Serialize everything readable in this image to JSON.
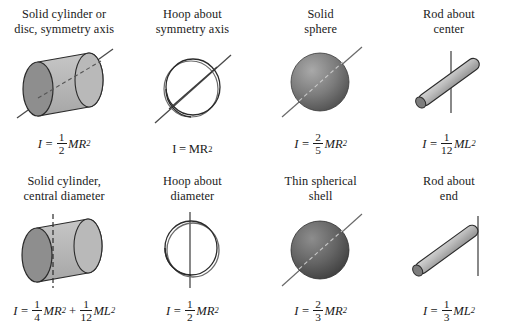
{
  "figure": {
    "columns": 4,
    "rows": 2,
    "background": "#ffffff",
    "ink": "#1a1a1a"
  },
  "palette": {
    "cylinder_body": "#b7b7b7",
    "cylinder_face": "#8e8e8e",
    "sphere_light": "#9a9a9a",
    "sphere_dark": "#4a4a4a",
    "shell_light": "#7e7e7e",
    "shell_dark": "#3a3a3a",
    "rod_body": "#c2c2c2",
    "rod_cap": "#7d7d7d",
    "outline": "#2b2b2b"
  },
  "cells": [
    {
      "id": "solid-cylinder-symmetry-axis",
      "caption": "Solid cylinder or\ndisc, symmetry axis",
      "shape": "cylinder-diagonal-axis",
      "formula": {
        "symbol": "I",
        "equals": "=",
        "terms": [
          {
            "numerator": "1",
            "denominator": "2",
            "body": "MR",
            "exponent": "2"
          }
        ],
        "text": "I = 1/2 MR^2"
      }
    },
    {
      "id": "hoop-symmetry-axis",
      "caption": "Hoop about\nsymmetry axis",
      "shape": "hoop-diagonal-axis",
      "formula": {
        "symbol": "I",
        "equals": "=",
        "terms": [
          {
            "numerator": "",
            "denominator": "",
            "body": "MR",
            "exponent": "2"
          }
        ],
        "text": "I = MR^2"
      }
    },
    {
      "id": "solid-sphere",
      "caption": "Solid\nsphere",
      "shape": "sphere-diagonal-axis",
      "formula": {
        "symbol": "I",
        "equals": "=",
        "terms": [
          {
            "numerator": "2",
            "denominator": "5",
            "body": "MR",
            "exponent": "2"
          }
        ],
        "text": "I = 2/5 MR^2"
      }
    },
    {
      "id": "rod-about-center",
      "caption": "Rod about\ncenter",
      "shape": "rod-center-axis",
      "formula": {
        "symbol": "I",
        "equals": "=",
        "terms": [
          {
            "numerator": "1",
            "denominator": "12",
            "body": "ML",
            "exponent": "2"
          }
        ],
        "text": "I = 1/12 ML^2"
      }
    },
    {
      "id": "solid-cylinder-central-diameter",
      "caption": "Solid cylinder,\ncentral diameter",
      "shape": "cylinder-vertical-axis",
      "formula": {
        "symbol": "I",
        "equals": "=",
        "terms": [
          {
            "numerator": "1",
            "denominator": "4",
            "body": "MR",
            "exponent": "2"
          },
          {
            "operator": "+",
            "numerator": "1",
            "denominator": "12",
            "body": "ML",
            "exponent": "2"
          }
        ],
        "text": "I = 1/4 MR^2 + 1/12 ML^2"
      }
    },
    {
      "id": "hoop-about-diameter",
      "caption": "Hoop about\ndiameter",
      "shape": "hoop-vertical-axis",
      "formula": {
        "symbol": "I",
        "equals": "=",
        "terms": [
          {
            "numerator": "1",
            "denominator": "2",
            "body": "MR",
            "exponent": "2"
          }
        ],
        "text": "I = 1/2 MR^2"
      }
    },
    {
      "id": "thin-spherical-shell",
      "caption": "Thin spherical\nshell",
      "shape": "shell-diagonal-axis",
      "formula": {
        "symbol": "I",
        "equals": "=",
        "terms": [
          {
            "numerator": "2",
            "denominator": "3",
            "body": "MR",
            "exponent": "2"
          }
        ],
        "text": "I = 2/3 MR^2"
      }
    },
    {
      "id": "rod-about-end",
      "caption": "Rod about\nend",
      "shape": "rod-end-axis",
      "formula": {
        "symbol": "I",
        "equals": "=",
        "terms": [
          {
            "numerator": "1",
            "denominator": "3",
            "body": "ML",
            "exponent": "2"
          }
        ],
        "text": "I = 1/3 ML^2"
      }
    }
  ]
}
